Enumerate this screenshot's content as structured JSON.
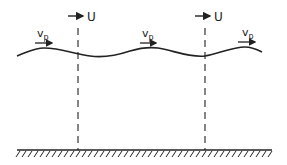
{
  "diagram": {
    "colors": {
      "ink": "#222222",
      "background": "#ffffff"
    },
    "reference_lines": [
      {
        "x": 78,
        "label": "U"
      },
      {
        "x": 205,
        "label": "U"
      }
    ],
    "phase_velocity_labels": [
      {
        "x": 38,
        "main": "v",
        "sub": "p"
      },
      {
        "x": 145,
        "main": "v",
        "sub": "p"
      },
      {
        "x": 242,
        "main": "v",
        "sub": "p"
      }
    ],
    "surface_wave": {
      "x_start": 17,
      "x_end": 262,
      "mean_y": 52
    },
    "bottom": {
      "y": 150,
      "x_start": 17,
      "x_end": 272,
      "style": "hatched"
    }
  }
}
